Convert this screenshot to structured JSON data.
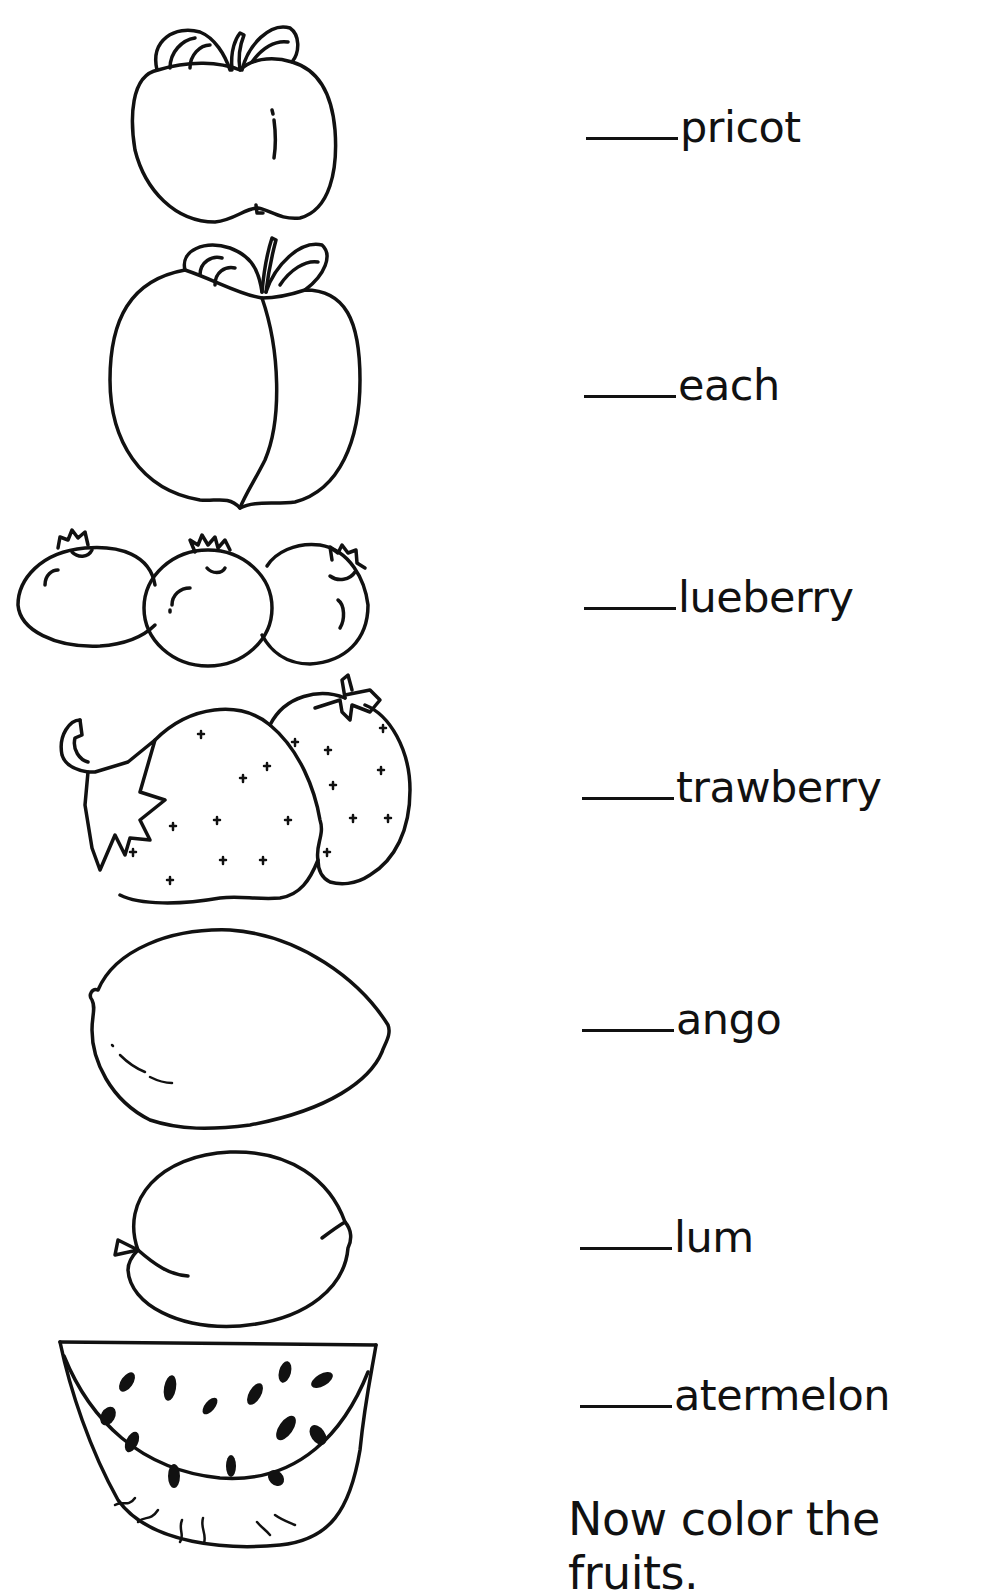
{
  "worksheet": {
    "items": [
      {
        "fruit": "apricot",
        "blank": "____",
        "word": "pricot",
        "icon": "apricot-icon"
      },
      {
        "fruit": "peach",
        "blank": "____",
        "word": "each",
        "icon": "peach-icon"
      },
      {
        "fruit": "blueberry",
        "blank": "____",
        "word": "lueberry",
        "icon": "blueberries-icon"
      },
      {
        "fruit": "strawberry",
        "blank": "____",
        "word": "trawberry",
        "icon": "strawberries-icon"
      },
      {
        "fruit": "mango",
        "blank": "____",
        "word": "ango",
        "icon": "mango-icon"
      },
      {
        "fruit": "plum",
        "blank": "____",
        "word": "lum",
        "icon": "plum-icon"
      },
      {
        "fruit": "watermelon",
        "blank": "____",
        "word": "atermelon",
        "icon": "watermelon-icon"
      }
    ],
    "instruction": "Now color the fruits."
  }
}
